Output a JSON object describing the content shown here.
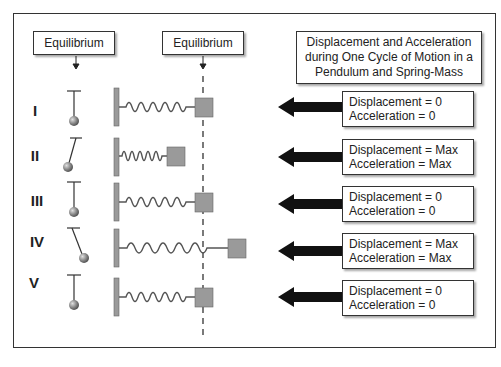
{
  "labels": {
    "equilibrium_pendulum": "Equilibrium",
    "equilibrium_spring": "Equilibrium",
    "title_lines": [
      "Displacement and Acceleration",
      "during One Cycle of Motion in a",
      "Pendulum and Spring-Mass"
    ]
  },
  "rows": [
    {
      "numeral": "I",
      "displacement": "Displacement = 0",
      "acceleration": "Acceleration = 0",
      "pendulum": "vertical",
      "spring": "equilibrium"
    },
    {
      "numeral": "II",
      "displacement": "Displacement = Max",
      "acceleration": "Acceleration = Max",
      "pendulum": "swung-right",
      "spring": "compressed"
    },
    {
      "numeral": "III",
      "displacement": "Displacement = 0",
      "acceleration": "Acceleration = 0",
      "pendulum": "vertical",
      "spring": "equilibrium"
    },
    {
      "numeral": "IV",
      "displacement": "Displacement = Max",
      "acceleration": "Acceleration = Max",
      "pendulum": "swung-left",
      "spring": "stretched"
    },
    {
      "numeral": "V",
      "displacement": "Displacement = 0",
      "acceleration": "Acceleration = 0",
      "pendulum": "vertical",
      "spring": "equilibrium"
    }
  ],
  "colors": {
    "mass": "#9a9a9a",
    "wall": "#9a9a9a",
    "arrow": "#111111",
    "bob": "#8a8a8a"
  }
}
